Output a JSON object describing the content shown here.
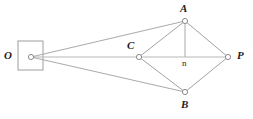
{
  "figure": {
    "type": "geometry-diagram",
    "width": 253,
    "height": 119,
    "background_color": "#ffffff",
    "line_color": "#a9a9a9",
    "node_stroke_color": "#8c8c8c",
    "node_fill_color": "#ffffff",
    "label_color": "#1d1d1d",
    "frame": {
      "label": "viewer-box",
      "x": 18,
      "y": 41,
      "width": 25,
      "height": 29,
      "stroke": "#9e9e9e"
    },
    "points": [
      {
        "id": "O",
        "label": "O",
        "x": 31,
        "y": 57,
        "label_x": 4,
        "label_y": 50,
        "style": "italic-bold"
      },
      {
        "id": "C",
        "label": "C",
        "x": 139,
        "y": 57,
        "label_x": 127,
        "label_y": 40,
        "style": "italic-bold"
      },
      {
        "id": "A",
        "label": "A",
        "x": 185,
        "y": 21,
        "label_x": 180,
        "label_y": 3,
        "style": "italic-bold"
      },
      {
        "id": "P",
        "label": "P",
        "x": 228,
        "y": 57,
        "label_x": 237,
        "label_y": 50,
        "style": "italic-bold"
      },
      {
        "id": "B",
        "label": "B",
        "x": 185,
        "y": 92,
        "label_x": 181,
        "label_y": 99,
        "style": "italic-bold"
      },
      {
        "id": "n",
        "label": "n",
        "x": 185,
        "y": 57,
        "label_x": 182,
        "label_y": 59,
        "style": "plain"
      }
    ],
    "edges": [
      {
        "from": "O",
        "to": "A",
        "name": "ray-o-a"
      },
      {
        "from": "O",
        "to": "P",
        "name": "ray-o-p"
      },
      {
        "from": "O",
        "to": "B",
        "name": "ray-o-b"
      },
      {
        "from": "C",
        "to": "A",
        "name": "edge-c-a"
      },
      {
        "from": "A",
        "to": "P",
        "name": "edge-a-p"
      },
      {
        "from": "P",
        "to": "B",
        "name": "edge-p-b"
      },
      {
        "from": "B",
        "to": "C",
        "name": "edge-b-c"
      },
      {
        "from": "A",
        "to": "n",
        "name": "altitude-a-n"
      }
    ]
  }
}
